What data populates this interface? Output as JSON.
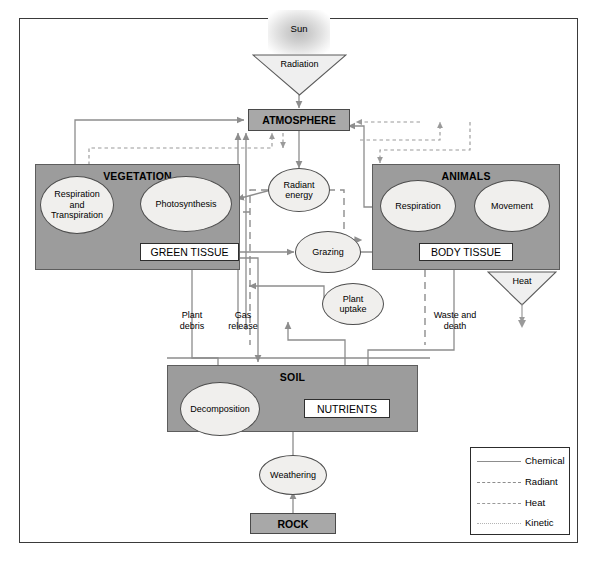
{
  "diagram": {
    "colors": {
      "compartment_fill": "#9c9c9c",
      "bar_fill": "#a8a8a8",
      "ellipse_fill": "#f0efed",
      "line_chemical": "#8d8d8d",
      "line_radiant": "#8d8d8d",
      "line_heat": "#9a9a9a",
      "line_kinetic": "#b4b4b4",
      "frame": "#3a3a3a"
    }
  },
  "sun": {
    "label": "Sun"
  },
  "radiation": {
    "label": "Radiation"
  },
  "heat_triangle": {
    "label": "Heat"
  },
  "atmosphere": {
    "label": "ATMOSPHERE"
  },
  "vegetation": {
    "title": "VEGETATION",
    "respiration": "Respiration\nand\nTranspiration",
    "respiration_line1": "Respiration",
    "respiration_line2": "and",
    "respiration_line3": "Transpiration",
    "photosynthesis": "Photosynthesis",
    "green_tissue": "GREEN TISSUE"
  },
  "animals": {
    "title": "ANIMALS",
    "respiration": "Respiration",
    "movement": "Movement",
    "body_tissue": "BODY TISSUE"
  },
  "soil": {
    "title": "SOIL",
    "decomposition": "Decomposition",
    "nutrients": "NUTRIENTS"
  },
  "rock": {
    "label": "ROCK"
  },
  "processes": {
    "radiant_energy_line1": "Radiant",
    "radiant_energy_line2": "energy",
    "grazing": "Grazing",
    "plant_uptake_line1": "Plant",
    "plant_uptake_line2": "uptake",
    "weathering": "Weathering"
  },
  "flow_labels": {
    "plant_debris_line1": "Plant",
    "plant_debris_line2": "debris",
    "gas_release_line1": "Gas",
    "gas_release_line2": "release",
    "waste_death_line1": "Waste and",
    "waste_death_line2": "death"
  },
  "legend": {
    "items": [
      {
        "label": "Chemical",
        "style": "solid"
      },
      {
        "label": "Radiant",
        "style": "dashed-long"
      },
      {
        "label": "Heat",
        "style": "dashed-short"
      },
      {
        "label": "Kinetic",
        "style": "dotted"
      }
    ]
  }
}
